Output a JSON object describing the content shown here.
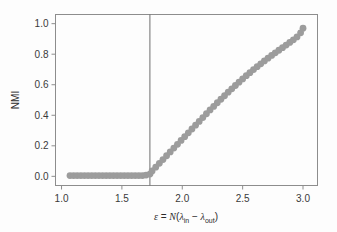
{
  "chart_data": {
    "type": "scatter",
    "title": "",
    "xlabel": "ε = N(λ_in − λ_out)",
    "ylabel": "NMI",
    "xlim": [
      0.95,
      3.12
    ],
    "ylim": [
      -0.06,
      1.06
    ],
    "grid": false,
    "legend": null,
    "xticks": [
      1.0,
      1.5,
      2.0,
      2.5,
      3.0
    ],
    "xticklabels": [
      "1.0",
      "1.5",
      "2.0",
      "2.5",
      "3.0"
    ],
    "yticks": [
      0.0,
      0.2,
      0.4,
      0.6,
      0.8,
      1.0
    ],
    "yticklabels": [
      "0.0",
      "0.2",
      "0.4",
      "0.6",
      "0.8",
      "1.0"
    ],
    "marker": "circle",
    "marker_color": "#9c9c9c",
    "marker_size": 3.4,
    "annotations": [
      {
        "name": "detectability-threshold-line",
        "type": "vline",
        "x": 1.732,
        "color": "#6f6f6f"
      }
    ],
    "x": [
      1.07,
      1.1,
      1.13,
      1.16,
      1.19,
      1.22,
      1.25,
      1.28,
      1.31,
      1.34,
      1.37,
      1.4,
      1.43,
      1.46,
      1.49,
      1.52,
      1.55,
      1.58,
      1.61,
      1.64,
      1.67,
      1.7,
      1.732,
      1.75,
      1.78,
      1.81,
      1.84,
      1.87,
      1.9,
      1.93,
      1.96,
      1.99,
      2.02,
      2.05,
      2.08,
      2.11,
      2.14,
      2.17,
      2.2,
      2.23,
      2.26,
      2.29,
      2.32,
      2.35,
      2.38,
      2.41,
      2.44,
      2.47,
      2.5,
      2.53,
      2.56,
      2.59,
      2.62,
      2.65,
      2.68,
      2.71,
      2.74,
      2.77,
      2.8,
      2.83,
      2.86,
      2.89,
      2.92,
      2.95,
      2.98,
      3.0
    ],
    "y": [
      0.005,
      0.005,
      0.005,
      0.005,
      0.005,
      0.005,
      0.005,
      0.005,
      0.005,
      0.005,
      0.005,
      0.005,
      0.005,
      0.005,
      0.005,
      0.005,
      0.005,
      0.005,
      0.005,
      0.005,
      0.005,
      0.008,
      0.015,
      0.035,
      0.06,
      0.085,
      0.11,
      0.135,
      0.16,
      0.185,
      0.21,
      0.235,
      0.26,
      0.285,
      0.31,
      0.335,
      0.36,
      0.385,
      0.41,
      0.435,
      0.458,
      0.482,
      0.505,
      0.528,
      0.551,
      0.573,
      0.595,
      0.617,
      0.638,
      0.659,
      0.679,
      0.699,
      0.718,
      0.737,
      0.756,
      0.774,
      0.792,
      0.809,
      0.826,
      0.843,
      0.86,
      0.877,
      0.894,
      0.913,
      0.94,
      0.97
    ]
  },
  "axes": {
    "frame_color": "#8d8d8d",
    "tick_color": "#8d8d8d"
  },
  "xlabel_parts": {
    "epsilon": "ε",
    "equals": " = ",
    "N": "N",
    "open_paren": "(",
    "lambda1": "λ",
    "sub_in": "in",
    "minus": " − ",
    "lambda2": "λ",
    "sub_out": "out",
    "close_paren": ")"
  }
}
